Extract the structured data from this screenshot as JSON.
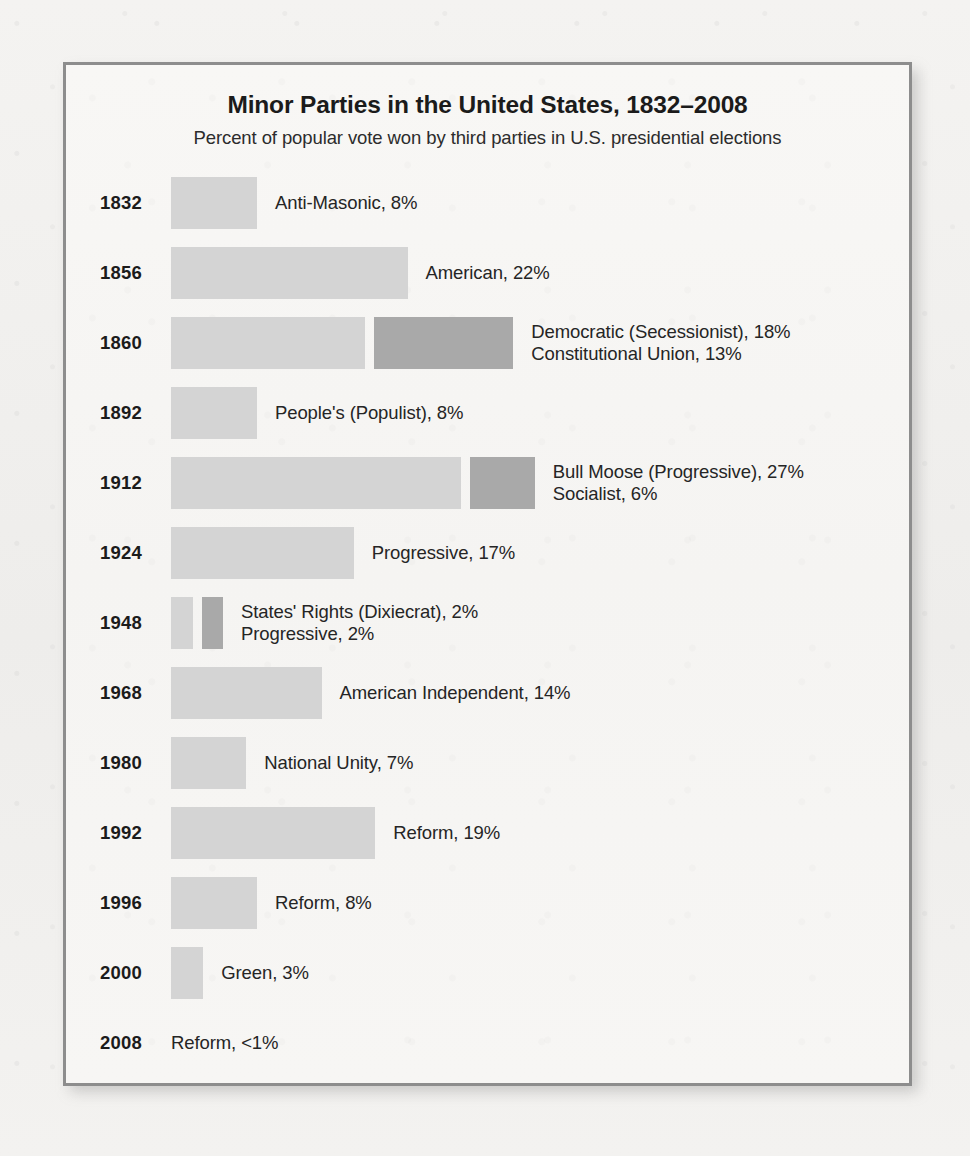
{
  "chart_data": {
    "type": "bar",
    "title": "Minor Parties in the United States, 1832–2008",
    "subtitle": "Percent of popular vote won by third parties in U.S. presidential elections",
    "xlabel": "",
    "ylabel": "",
    "orientation": "horizontal",
    "stacked": true,
    "grid": false,
    "legend": "none",
    "value_unit": "percent",
    "xlim": [
      0,
      33
    ],
    "colors": {
      "segment_primary": "#d4d4d4",
      "segment_secondary": "#a9a9a9",
      "frame_border": "#8d8d8d",
      "panel_background": "#f7f6f4",
      "text": "#1b1b1b"
    },
    "categories": [
      "1832",
      "1856",
      "1860",
      "1892",
      "1912",
      "1924",
      "1948",
      "1968",
      "1980",
      "1992",
      "1996",
      "2000",
      "2008"
    ],
    "rows": [
      {
        "year": "1832",
        "segments": [
          {
            "party": "Anti-Masonic",
            "value": 8,
            "shade": "primary"
          }
        ],
        "labels": [
          "Anti-Masonic, 8%"
        ]
      },
      {
        "year": "1856",
        "segments": [
          {
            "party": "American",
            "value": 22,
            "shade": "primary"
          }
        ],
        "labels": [
          "American, 22%"
        ]
      },
      {
        "year": "1860",
        "segments": [
          {
            "party": "Democratic (Secessionist)",
            "value": 18,
            "shade": "primary"
          },
          {
            "party": "Constitutional Union",
            "value": 13,
            "shade": "secondary"
          }
        ],
        "labels": [
          "Democratic (Secessionist), 18%",
          "Constitutional Union, 13%"
        ]
      },
      {
        "year": "1892",
        "segments": [
          {
            "party": "People's (Populist)",
            "value": 8,
            "shade": "primary"
          }
        ],
        "labels": [
          "People's (Populist), 8%"
        ]
      },
      {
        "year": "1912",
        "segments": [
          {
            "party": "Bull Moose (Progressive)",
            "value": 27,
            "shade": "primary"
          },
          {
            "party": "Socialist",
            "value": 6,
            "shade": "secondary"
          }
        ],
        "labels": [
          "Bull Moose (Progressive), 27%",
          "Socialist, 6%"
        ]
      },
      {
        "year": "1924",
        "segments": [
          {
            "party": "Progressive",
            "value": 17,
            "shade": "primary"
          }
        ],
        "labels": [
          "Progressive, 17%"
        ]
      },
      {
        "year": "1948",
        "segments": [
          {
            "party": "States' Rights (Dixiecrat)",
            "value": 2,
            "shade": "primary"
          },
          {
            "party": "Progressive",
            "value": 2,
            "shade": "secondary"
          }
        ],
        "labels": [
          "States' Rights (Dixiecrat), 2%",
          "Progressive, 2%"
        ]
      },
      {
        "year": "1968",
        "segments": [
          {
            "party": "American Independent",
            "value": 14,
            "shade": "primary"
          }
        ],
        "labels": [
          "American Independent, 14%"
        ]
      },
      {
        "year": "1980",
        "segments": [
          {
            "party": "National Unity",
            "value": 7,
            "shade": "primary"
          }
        ],
        "labels": [
          "National Unity, 7%"
        ]
      },
      {
        "year": "1992",
        "segments": [
          {
            "party": "Reform",
            "value": 19,
            "shade": "primary"
          }
        ],
        "labels": [
          "Reform, 19%"
        ]
      },
      {
        "year": "1996",
        "segments": [
          {
            "party": "Reform",
            "value": 8,
            "shade": "primary"
          }
        ],
        "labels": [
          "Reform, 8%"
        ]
      },
      {
        "year": "2000",
        "segments": [
          {
            "party": "Green",
            "value": 3,
            "shade": "primary"
          }
        ],
        "labels": [
          "Green, 3%"
        ]
      },
      {
        "year": "2008",
        "segments": [],
        "labels": [
          "Reform, <1%"
        ]
      }
    ]
  }
}
